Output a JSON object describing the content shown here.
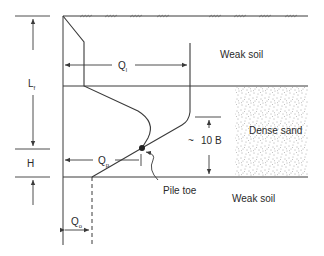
{
  "diagram": {
    "type": "pile-load-transfer",
    "layers": [
      {
        "name": "top-layer",
        "label": "Weak soil"
      },
      {
        "name": "bearing-layer",
        "label": "Dense sand"
      },
      {
        "name": "bottom-layer",
        "label": "Weak soil"
      }
    ],
    "dimensions": {
      "embedment_label": "L",
      "embedment_sub": "f",
      "bearing_label": "H",
      "influence_label": "10 B",
      "influence_tilde": "~"
    },
    "loads": {
      "shaft_label": "Q",
      "shaft_sub": "l",
      "point_label": "Q",
      "point_sub": "p",
      "reduced_label": "Q",
      "reduced_sub": "o"
    },
    "annotations": {
      "pile_toe": "Pile toe"
    },
    "colors": {
      "line": "#3a3a3a",
      "text": "#2a2a2a",
      "stipple": "#555555",
      "background": "#ffffff"
    }
  }
}
